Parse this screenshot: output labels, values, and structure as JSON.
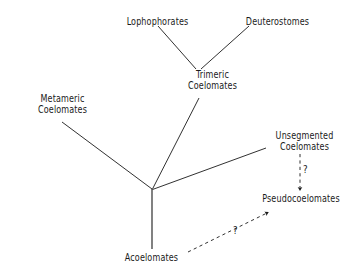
{
  "diagram": {
    "type": "phylogenetic-tree",
    "background_color": "#ffffff",
    "line_color": "#1a1a1a",
    "text_color": "#1a1a1a",
    "nodes": [
      {
        "id": "lophophorates",
        "label_lines": [
          "Lophophorates"
        ],
        "x": 157,
        "y": 22
      },
      {
        "id": "deuterostomes",
        "label_lines": [
          "Deuterostomes"
        ],
        "x": 277,
        "y": 22
      },
      {
        "id": "trimeric",
        "label_lines": [
          "Trimeric",
          "Coelomates"
        ],
        "x": 212,
        "y": 80
      },
      {
        "id": "metameric",
        "label_lines": [
          "Metameric",
          "Coelomates"
        ],
        "x": 62,
        "y": 104
      },
      {
        "id": "unsegmented",
        "label_lines": [
          "Unsegmented",
          "Coelomates"
        ],
        "x": 304,
        "y": 141
      },
      {
        "id": "pseudocoelomates",
        "label_lines": [
          "Pseudocoelomates"
        ],
        "x": 301,
        "y": 199
      },
      {
        "id": "acoelomates",
        "label_lines": [
          "Acoelomates"
        ],
        "x": 151,
        "y": 258
      }
    ],
    "branches": [
      {
        "id": "lophophorates-to-trimeric",
        "style": "solid",
        "from": "lophophorates",
        "to": "trimeric"
      },
      {
        "id": "deuterostomes-to-trimeric",
        "style": "solid",
        "from": "deuterostomes",
        "to": "trimeric"
      },
      {
        "id": "trimeric-to-root",
        "style": "solid",
        "from": "trimeric",
        "to": "root"
      },
      {
        "id": "metameric-to-root",
        "style": "solid",
        "from": "metameric",
        "to": "root"
      },
      {
        "id": "unsegmented-to-root",
        "style": "solid",
        "from": "unsegmented",
        "to": "root"
      },
      {
        "id": "acoelomates-to-root",
        "style": "solid",
        "from": "acoelomates",
        "to": "root"
      }
    ],
    "uncertain_links": [
      {
        "id": "unsegmented-to-pseudocoelomates",
        "style": "dashed",
        "arrow": true,
        "marker": "?",
        "from": "unsegmented",
        "to": "pseudocoelomates"
      },
      {
        "id": "acoelomates-to-pseudocoelomates",
        "style": "dashed",
        "arrow": true,
        "marker": "?",
        "from": "acoelomates",
        "to": "pseudocoelomates"
      }
    ],
    "markers": {
      "vertical_question": "?",
      "diagonal_question": "?"
    }
  }
}
